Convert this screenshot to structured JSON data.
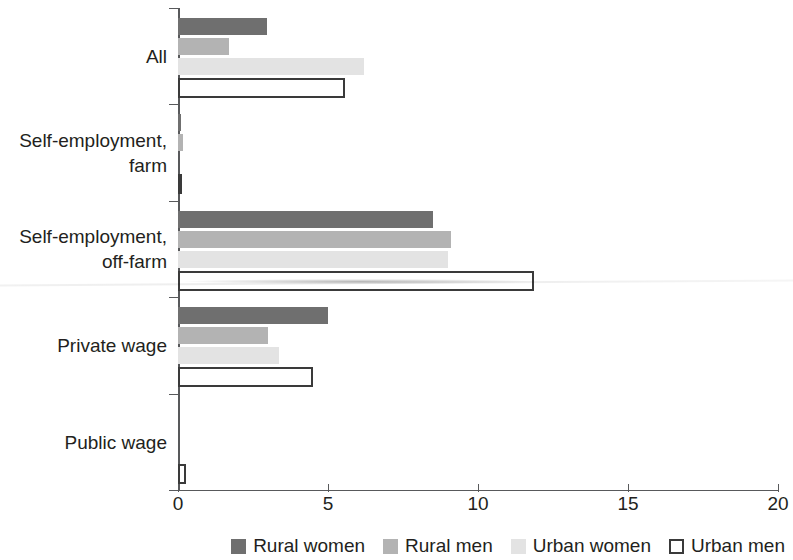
{
  "chart_data": {
    "type": "bar",
    "orientation": "horizontal",
    "title": "",
    "subtitle": "",
    "xlabel": "",
    "ylabel": "",
    "xlim": [
      0,
      20
    ],
    "xticks": [
      0,
      5,
      10,
      15,
      20
    ],
    "xtick_labels": [
      "0",
      "5",
      "10",
      "15",
      "20"
    ],
    "grid": false,
    "legend_position": "bottom-right",
    "categories": [
      "All",
      "Self-employment,\nfarm",
      "Self-employment,\noff-farm",
      "Private wage",
      "Public wage"
    ],
    "series": [
      {
        "name": "Rural women",
        "color": "#6f6f6f",
        "values": [
          2.95,
          0.1,
          8.5,
          5.0,
          0.0
        ]
      },
      {
        "name": "Rural men",
        "color": "#b3b3b3",
        "values": [
          1.7,
          0.15,
          9.1,
          3.0,
          0.0
        ]
      },
      {
        "name": "Urban women",
        "color": "#e3e3e3",
        "values": [
          6.2,
          0.0,
          9.0,
          3.35,
          0.0
        ]
      },
      {
        "name": "Urban men",
        "color": "#ffffff",
        "values": [
          5.55,
          0.1,
          11.85,
          4.5,
          0.25
        ]
      }
    ]
  },
  "axis": {
    "x_tick_labels": [
      "0",
      "5",
      "10",
      "15",
      "20"
    ],
    "category_labels": [
      "All",
      "Self-employment,\nfarm",
      "Self-employment,\noff-farm",
      "Private wage",
      "Public wage"
    ]
  },
  "legend": {
    "items": [
      {
        "label": "Rural women",
        "swatch": "filled-dark-gray"
      },
      {
        "label": "Rural men",
        "swatch": "filled-mid-gray"
      },
      {
        "label": "Urban women",
        "swatch": "filled-light-gray"
      },
      {
        "label": "Urban men",
        "swatch": "outlined-white"
      }
    ]
  },
  "colors": {
    "rural_women": "#6f6f6f",
    "rural_men": "#b3b3b3",
    "urban_women": "#e3e3e3",
    "urban_men_outline": "#3a3a3a",
    "axis": "#58595b",
    "text": "#231f20"
  }
}
